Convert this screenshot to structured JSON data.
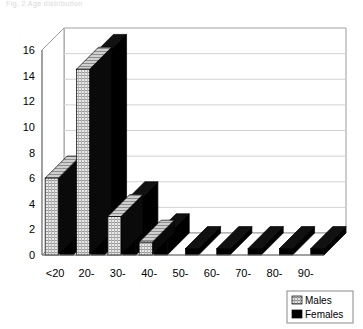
{
  "header": {
    "caption": "Fig. 2   Age distribution"
  },
  "legend": {
    "position": "bottom-right",
    "items": [
      {
        "label": "Males",
        "swatch": "hatched-grid-light",
        "color": "#d9d9d9"
      },
      {
        "label": "Females",
        "swatch": "solid-black",
        "color": "#000000"
      }
    ]
  },
  "chart_data": {
    "type": "bar",
    "title": "",
    "xlabel": "",
    "ylabel": "",
    "grid": true,
    "ylim": [
      0,
      16
    ],
    "yticks": [
      "0",
      "2",
      "4",
      "6",
      "8",
      "10",
      "12",
      "14",
      "16"
    ],
    "ytick_values": [
      0,
      2,
      4,
      6,
      8,
      10,
      12,
      14,
      16
    ],
    "categories": [
      "<20",
      "20-",
      "30-",
      "40-",
      "50-",
      "60-",
      "70-",
      "80-",
      "90-"
    ],
    "series": [
      {
        "name": "Males",
        "color": "#d9d9d9",
        "values": [
          6,
          14.5,
          3,
          1,
          0,
          0,
          0,
          0,
          0
        ]
      },
      {
        "name": "Females",
        "color": "#000000",
        "values": [
          6,
          15.5,
          4,
          1.5,
          0.5,
          0.5,
          0.5,
          0.5,
          0.5
        ]
      }
    ],
    "style": "3d-perspective",
    "legend_position": "bottom-right"
  }
}
